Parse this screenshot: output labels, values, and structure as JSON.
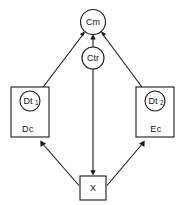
{
  "diagram": {
    "canvas": {
      "width": 184,
      "height": 205
    },
    "colors": {
      "background": "#ffffff",
      "stroke": "#1a1a1a",
      "text": "#111111",
      "fill": "#ffffff"
    },
    "nodes": {
      "cm": {
        "label": "Cm",
        "shape": "circle",
        "cx": 93,
        "cy": 22,
        "r": 12.5
      },
      "ctr": {
        "label": "Ctr",
        "shape": "circle",
        "cx": 93,
        "cy": 58,
        "r": 11
      },
      "dt1": {
        "label": "Dt",
        "sublabel": "1",
        "shape": "circle",
        "cx": 30,
        "cy": 101,
        "r": 10
      },
      "dt2": {
        "label": "Dt",
        "sublabel": "2",
        "shape": "circle",
        "cx": 155,
        "cy": 101,
        "r": 10
      },
      "dc_box": {
        "caption": "Dc",
        "shape": "rect",
        "x": 11,
        "y": 87,
        "w": 38,
        "h": 50
      },
      "ec_box": {
        "caption": "Ec",
        "shape": "rect",
        "x": 136,
        "y": 87,
        "w": 38,
        "h": 50
      },
      "x_box": {
        "label": "X",
        "shape": "rect",
        "x": 80,
        "y": 176,
        "w": 26,
        "h": 24
      }
    },
    "edges": [
      {
        "name": "dt1-to-cm",
        "from": "dt1",
        "to": "cm",
        "arrow_at": "cm"
      },
      {
        "name": "dt2-to-cm",
        "from": "dt2",
        "to": "cm",
        "arrow_at": "cm"
      },
      {
        "name": "ctr-to-cm",
        "from": "ctr",
        "to": "cm",
        "arrow_at": "cm"
      },
      {
        "name": "ctr-to-x",
        "from": "ctr",
        "to": "x_box",
        "arrow_at": "x_box"
      },
      {
        "name": "x-to-dc-box",
        "from": "x_box",
        "to": "dc_box",
        "arrow_at": "dc_box"
      },
      {
        "name": "x-to-ec-box",
        "from": "x_box",
        "to": "ec_box",
        "arrow_at": "ec_box"
      }
    ]
  }
}
